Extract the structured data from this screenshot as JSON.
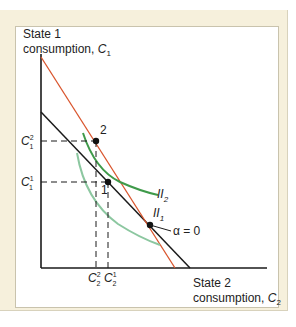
{
  "axes": {
    "y_label_line1": "State 1",
    "y_label_line2": "consumption, ",
    "y_label_var": "C",
    "y_label_sub": "1",
    "x_label_line1": "State 2",
    "x_label_line2": "consumption, ",
    "x_label_var": "C",
    "x_label_sub": "2"
  },
  "ticks": {
    "c1_2": {
      "var": "C",
      "sub": "1",
      "sup": "2"
    },
    "c1_1": {
      "var": "C",
      "sub": "1",
      "sup": "1"
    },
    "c2_2": {
      "var": "C",
      "sub": "2",
      "sup": "2"
    },
    "c2_1": {
      "var": "C",
      "sub": "2",
      "sup": "1"
    }
  },
  "points": {
    "p2": "2",
    "p1": "1",
    "alpha": "α = 0"
  },
  "curves": {
    "ii2": {
      "base": "II",
      "sub": "2"
    },
    "ii1": {
      "base": "II",
      "sub": "1"
    }
  },
  "colors": {
    "budget_black": "#1a1a1a",
    "budget_red": "#d9542c",
    "ii2_green": "#3f9a4a",
    "ii1_green": "#8cc7a0",
    "frame": "#f6f0dc"
  }
}
